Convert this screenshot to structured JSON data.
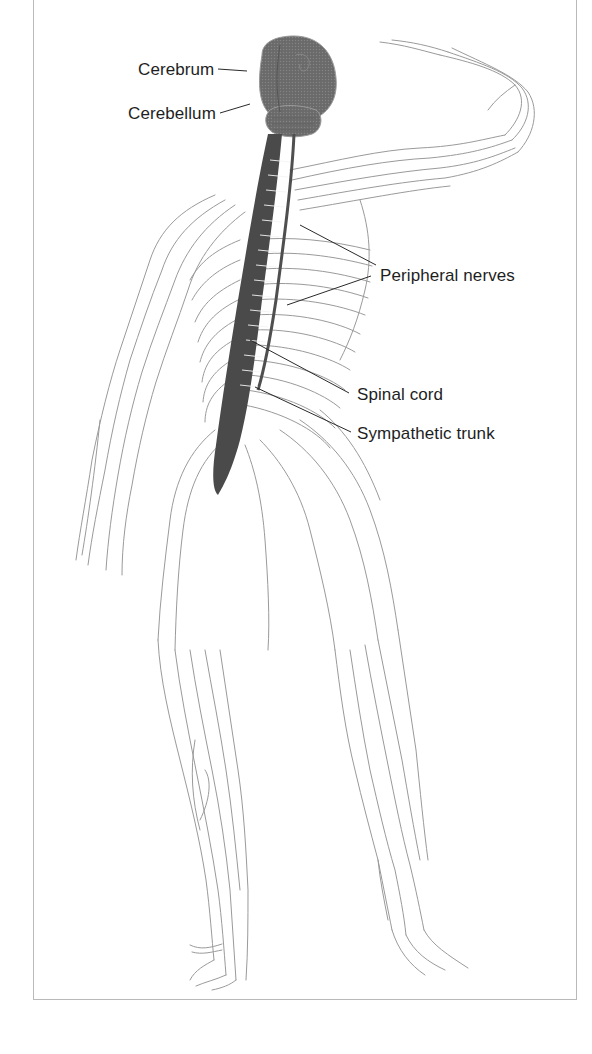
{
  "figure": {
    "labels": {
      "cerebrum": "Cerebrum",
      "cerebellum": "Cerebellum",
      "peripheral_nerves": "Peripheral nerves",
      "spinal_cord": "Spinal cord",
      "sympathetic_trunk": "Sympathetic trunk"
    },
    "colors": {
      "brain_fill": "#6e6e6e",
      "spinal_cord": "#4a4a4a",
      "nerve_lines": "#8c8c8c",
      "leader_lines": "#2a2a2a",
      "frame_border": "#b9b9b9",
      "label_text": "#1e1e1e"
    }
  }
}
